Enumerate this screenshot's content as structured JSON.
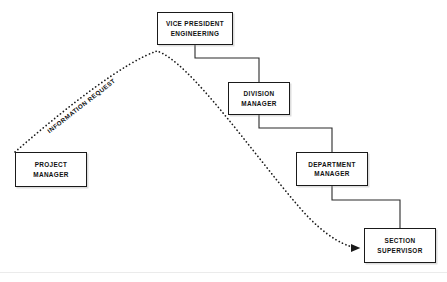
{
  "diagram": {
    "style": {
      "line_color": "#1a1a1a",
      "box_fill": "#ffffff",
      "background": "#ffffff",
      "dotted_path_color": "#1a1a1a"
    },
    "boxes": [
      {
        "id": "vice-president-engineering",
        "line1": "VICE PRESIDENT",
        "line2": "ENGINEERING",
        "x": 157,
        "y": 12,
        "width": 76,
        "height": 33
      },
      {
        "id": "division-manager",
        "line1": "DIVISION",
        "line2": "MANAGER",
        "x": 228,
        "y": 82,
        "width": 62,
        "height": 33
      },
      {
        "id": "department-manager",
        "line1": "DEPARTMENT",
        "line2": "MANAGER",
        "x": 296,
        "y": 152,
        "width": 72,
        "height": 34
      },
      {
        "id": "section-supervisor",
        "line1": "SECTION",
        "line2": "SUPERVISOR",
        "x": 364,
        "y": 228,
        "width": 72,
        "height": 35
      },
      {
        "id": "project-manager",
        "line1": "PROJECT",
        "line2": "MANAGER",
        "x": 15,
        "y": 152,
        "width": 72,
        "height": 35
      }
    ],
    "flow_label": {
      "text": "INFORMATION REQUEST",
      "x": 48,
      "y": 128,
      "rotation_deg": -38
    },
    "connectors": [
      {
        "id": "vp-to-division",
        "from": "vice-president-engineering",
        "to": "division-manager"
      },
      {
        "id": "division-to-department",
        "from": "division-manager",
        "to": "department-manager"
      },
      {
        "id": "department-to-section",
        "from": "department-manager",
        "to": "section-supervisor"
      }
    ],
    "flow_path": {
      "id": "information-request-path",
      "from": "project-manager",
      "to": "section-supervisor",
      "style": "dotted",
      "arrowhead": "at-target"
    }
  }
}
